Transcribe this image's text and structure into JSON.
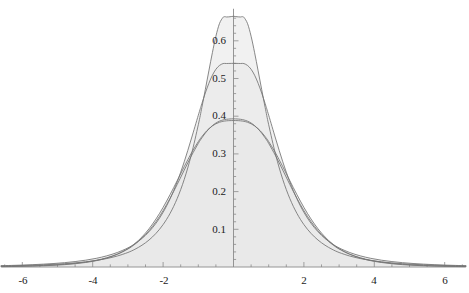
{
  "chart_data": {
    "type": "line",
    "title": "",
    "subtitle": "",
    "xlabel": "",
    "ylabel": "",
    "xlim": [
      -6.6,
      6.6
    ],
    "ylim": [
      0,
      0.69
    ],
    "grid": false,
    "legend": "none",
    "filled": true,
    "fill_color": "#e9e9e9",
    "curve_color": "#737373",
    "axis_color": "#8a8a8a",
    "text_color": "#1a1a1a",
    "x_ticks_major": [
      -6,
      -4,
      -2,
      2,
      4,
      6
    ],
    "x_tick_labels": [
      "-6",
      "-4",
      "-2",
      "2",
      "4",
      "6"
    ],
    "x_tick_minor_step": 0.5,
    "y_ticks_major": [
      0.1,
      0.2,
      0.3,
      0.4,
      0.5,
      0.6
    ],
    "y_tick_labels": [
      "0.1",
      "0.2",
      "0.3",
      "0.4",
      "0.5",
      "0.6"
    ],
    "y_tick_minor_step": 0.02,
    "x_sample": [
      -6.6,
      -6.3,
      -6,
      -5.7,
      -5.4,
      -5.1,
      -4.8,
      -4.5,
      -4.2,
      -3.9,
      -3.6,
      -3.3,
      -3,
      -2.8,
      -2.6,
      -2.4,
      -2.2,
      -2,
      -1.8,
      -1.6,
      -1.4,
      -1.2,
      -1,
      -0.9,
      -0.8,
      -0.7,
      -0.6,
      -0.5,
      -0.4,
      -0.3,
      -0.25,
      -0.2,
      -0.15,
      -0.1,
      -0.05,
      0,
      0.05,
      0.1,
      0.15,
      0.2,
      0.25,
      0.3,
      0.4,
      0.5,
      0.6,
      0.7,
      0.8,
      0.9,
      1,
      1.2,
      1.4,
      1.6,
      1.8,
      2,
      2.2,
      2.4,
      2.6,
      2.8,
      3,
      3.3,
      3.6,
      3.9,
      4.2,
      4.5,
      4.8,
      5.1,
      5.4,
      5.7,
      6,
      6.3,
      6.6
    ],
    "series": [
      {
        "name": "sharp-peak-curve",
        "peak": 0.665,
        "values": [
          0.0028,
          0.0033,
          0.004,
          0.0048,
          0.0058,
          0.0071,
          0.0088,
          0.0109,
          0.0137,
          0.0174,
          0.0224,
          0.0292,
          0.0385,
          0.047,
          0.0578,
          0.0716,
          0.0894,
          0.1125,
          0.1425,
          0.1816,
          0.2322,
          0.2968,
          0.3773,
          0.4228,
          0.471,
          0.5202,
          0.5685,
          0.6121,
          0.6454,
          0.6618,
          0.664,
          0.6632,
          0.6634,
          0.6638,
          0.6645,
          0.665,
          0.6645,
          0.6638,
          0.6634,
          0.6632,
          0.664,
          0.6618,
          0.6454,
          0.6121,
          0.5685,
          0.5202,
          0.471,
          0.4228,
          0.3773,
          0.2968,
          0.2322,
          0.1816,
          0.1425,
          0.1125,
          0.0894,
          0.0716,
          0.0578,
          0.047,
          0.0385,
          0.0292,
          0.0224,
          0.0174,
          0.0137,
          0.0109,
          0.0088,
          0.0071,
          0.0058,
          0.0048,
          0.004,
          0.0033,
          0.0028
        ]
      },
      {
        "name": "medium-peak-curve",
        "peak": 0.512,
        "values": [
          0.0035,
          0.0042,
          0.0051,
          0.0062,
          0.0076,
          0.0093,
          0.0115,
          0.0144,
          0.0181,
          0.023,
          0.0296,
          0.0385,
          0.0507,
          0.0618,
          0.0758,
          0.0936,
          0.1162,
          0.145,
          0.1812,
          0.2258,
          0.2791,
          0.3395,
          0.4025,
          0.433,
          0.4617,
          0.4873,
          0.5086,
          0.5245,
          0.5345,
          0.5395,
          0.54,
          0.5398,
          0.5399,
          0.54,
          0.5401,
          0.5402,
          0.5401,
          0.54,
          0.5399,
          0.5398,
          0.54,
          0.5395,
          0.5345,
          0.5245,
          0.5086,
          0.4873,
          0.4617,
          0.433,
          0.4025,
          0.3395,
          0.2791,
          0.2258,
          0.1812,
          0.145,
          0.1162,
          0.0936,
          0.0758,
          0.0618,
          0.0507,
          0.0385,
          0.0296,
          0.023,
          0.0181,
          0.0144,
          0.0115,
          0.0093,
          0.0076,
          0.0062,
          0.0051,
          0.0042,
          0.0035
        ]
      },
      {
        "name": "rounded-peak-curve-a",
        "peak": 0.427,
        "values": [
          0.0015,
          0.0019,
          0.0025,
          0.0032,
          0.0042,
          0.0055,
          0.0073,
          0.0097,
          0.0131,
          0.0178,
          0.0245,
          0.0341,
          0.0478,
          0.0604,
          0.0764,
          0.0963,
          0.1206,
          0.1494,
          0.1825,
          0.2189,
          0.2569,
          0.2942,
          0.3278,
          0.3424,
          0.3552,
          0.3661,
          0.375,
          0.3819,
          0.3868,
          0.39,
          0.391,
          0.3918,
          0.3923,
          0.3927,
          0.3929,
          0.393,
          0.3929,
          0.3927,
          0.3923,
          0.3918,
          0.391,
          0.39,
          0.3868,
          0.3819,
          0.375,
          0.3661,
          0.3552,
          0.3424,
          0.3278,
          0.2942,
          0.2569,
          0.2189,
          0.1825,
          0.1494,
          0.1206,
          0.0963,
          0.0764,
          0.0604,
          0.0478,
          0.0341,
          0.0245,
          0.0178,
          0.0131,
          0.0097,
          0.0073,
          0.0055,
          0.0042,
          0.0032,
          0.0025,
          0.0019,
          0.0015
        ]
      },
      {
        "name": "rounded-peak-curve-b",
        "peak": 0.4,
        "values": [
          0.001,
          0.0013,
          0.0018,
          0.0024,
          0.0033,
          0.0045,
          0.0062,
          0.0086,
          0.012,
          0.0168,
          0.0238,
          0.0339,
          0.0486,
          0.0623,
          0.0797,
          0.1014,
          0.1276,
          0.1581,
          0.1923,
          0.2289,
          0.2661,
          0.3016,
          0.3326,
          0.3458,
          0.3572,
          0.3667,
          0.3742,
          0.3799,
          0.3839,
          0.3864,
          0.3871,
          0.3877,
          0.3881,
          0.3883,
          0.3884,
          0.3885,
          0.3884,
          0.3883,
          0.3881,
          0.3877,
          0.3871,
          0.3864,
          0.3839,
          0.3799,
          0.3742,
          0.3667,
          0.3572,
          0.3458,
          0.3326,
          0.3016,
          0.2661,
          0.2289,
          0.1923,
          0.1581,
          0.1276,
          0.1014,
          0.0797,
          0.0623,
          0.0486,
          0.0339,
          0.0238,
          0.0168,
          0.012,
          0.0086,
          0.0062,
          0.0045,
          0.0033,
          0.0024,
          0.0018,
          0.0013,
          0.001
        ]
      }
    ]
  },
  "axes": {
    "origin_px": {
      "x": 233.5,
      "y": 267.0
    },
    "px_per_x_unit": 35.2,
    "px_per_y_unit": 377.0
  }
}
